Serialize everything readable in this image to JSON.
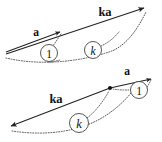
{
  "figure": {
    "background_color": "#ffffff",
    "line_color": "#222222",
    "dotted_color": "#555555",
    "circle_stroke": "#444444"
  },
  "diagram_top": {
    "name": "top-panel",
    "vector_short_label": "a",
    "vector_long_label": "ka",
    "marker_unit_label": "1",
    "marker_scale_label": "k",
    "arrow_short": {
      "x1": 6,
      "y1": 52,
      "x2": 62,
      "y2": 31,
      "head": "end"
    },
    "arrow_long": {
      "x1": 6,
      "y1": 54,
      "x2": 146,
      "y2": 7,
      "head": "end"
    },
    "axis_curve": "M 6,58 C 40,66 80,62 112,51 C 128,44 138,28 146,12",
    "leader_unit": "M 50,58 C 54,52 58,45 62,33",
    "leader_scale": "M 92,50 C 100,46 106,40 112,34",
    "circle_unit": {
      "cx": 49,
      "cy": 53,
      "r": 8.5
    },
    "circle_scale": {
      "cx": 93,
      "cy": 50,
      "r": 8.5
    },
    "label_short_pos": {
      "x": 36,
      "y": 36
    },
    "label_long_pos": {
      "x": 105,
      "y": 15
    }
  },
  "diagram_bottom": {
    "name": "bottom-panel",
    "vector_short_label": "a",
    "vector_long_label": "ka",
    "marker_unit_label": "1",
    "marker_scale_label": "k",
    "arrow_short": {
      "x1": 110,
      "y1": 87,
      "x2": 152,
      "y2": 78,
      "head": "end"
    },
    "arrow_long": {
      "x1": 110,
      "y1": 88,
      "x2": 10,
      "y2": 127,
      "head": "end"
    },
    "junction_dot": {
      "cx": 110,
      "cy": 88,
      "r": 2.0
    },
    "axis_curve": "M 10,132 C 45,137 78,133 104,120 C 118,112 128,100 138,86",
    "leader_unit": "M 120,90 C 124,90 128,90 131,90",
    "leader_scale": "M 62,130 C 72,130 82,126 92,116",
    "circle_unit": {
      "cx": 139,
      "cy": 90,
      "r": 8.5
    },
    "circle_scale": {
      "cx": 79,
      "cy": 123,
      "r": 9.5
    },
    "label_short_pos": {
      "x": 125,
      "y": 74
    },
    "label_long_pos": {
      "x": 55,
      "y": 102
    }
  }
}
